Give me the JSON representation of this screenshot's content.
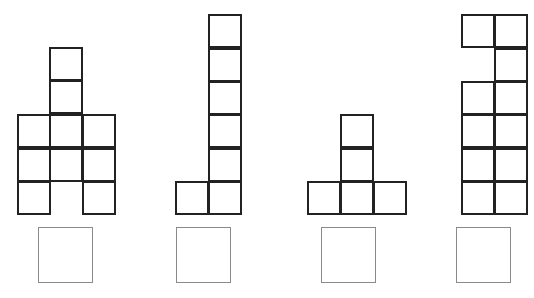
{
  "diagram": {
    "title": "",
    "cell_size": 33,
    "stroke_color": "#222222",
    "answer_box_color": "#8a8a8a",
    "figures": [
      {
        "id": "figure-1",
        "description": "Arch shape: 3 columns; left and right columns 3 tall, middle column 4 tall with bottom row empty",
        "cells": [
          {
            "x": 49,
            "y": 47
          },
          {
            "x": 49,
            "y": 80
          },
          {
            "x": 17,
            "y": 114
          },
          {
            "x": 49,
            "y": 114
          },
          {
            "x": 82,
            "y": 114
          },
          {
            "x": 17,
            "y": 148
          },
          {
            "x": 49,
            "y": 148
          },
          {
            "x": 82,
            "y": 148
          },
          {
            "x": 17,
            "y": 181
          },
          {
            "x": 82,
            "y": 181
          }
        ],
        "answer_box": {
          "x": 38,
          "y": 227,
          "w": 55,
          "h": 56,
          "value": ""
        }
      },
      {
        "id": "figure-2",
        "description": "L shape: column of 6 with one extra cell at bottom-left",
        "cells": [
          {
            "x": 208,
            "y": 14
          },
          {
            "x": 208,
            "y": 48
          },
          {
            "x": 208,
            "y": 81
          },
          {
            "x": 208,
            "y": 114
          },
          {
            "x": 208,
            "y": 148
          },
          {
            "x": 175,
            "y": 181
          },
          {
            "x": 208,
            "y": 181
          }
        ],
        "answer_box": {
          "x": 176,
          "y": 227,
          "w": 55,
          "h": 56,
          "value": ""
        }
      },
      {
        "id": "figure-3",
        "description": "Inverted T: row of 3 with column of 2 on middle",
        "cells": [
          {
            "x": 340,
            "y": 114
          },
          {
            "x": 340,
            "y": 148
          },
          {
            "x": 307,
            "y": 181
          },
          {
            "x": 340,
            "y": 181
          },
          {
            "x": 373,
            "y": 181
          }
        ],
        "answer_box": {
          "x": 321,
          "y": 227,
          "w": 55,
          "h": 56,
          "value": ""
        }
      },
      {
        "id": "figure-4",
        "description": "Two-column shape of 11 cells with gap at left column second row",
        "cells": [
          {
            "x": 461,
            "y": 14
          },
          {
            "x": 494,
            "y": 14
          },
          {
            "x": 494,
            "y": 48
          },
          {
            "x": 461,
            "y": 81
          },
          {
            "x": 494,
            "y": 81
          },
          {
            "x": 461,
            "y": 114
          },
          {
            "x": 494,
            "y": 114
          },
          {
            "x": 461,
            "y": 148
          },
          {
            "x": 494,
            "y": 148
          },
          {
            "x": 461,
            "y": 181
          },
          {
            "x": 494,
            "y": 181
          }
        ],
        "answer_box": {
          "x": 456,
          "y": 227,
          "w": 55,
          "h": 56,
          "value": ""
        }
      }
    ]
  }
}
